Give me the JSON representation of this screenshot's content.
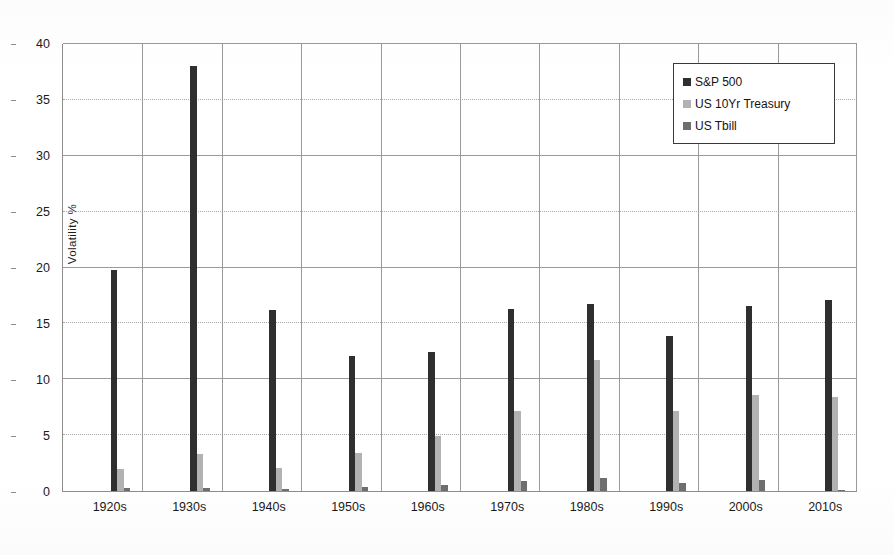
{
  "chart_data": {
    "type": "bar",
    "title": "",
    "subtitle": "",
    "xlabel": "",
    "ylabel": "Volatility  %",
    "ylim": [
      0,
      40
    ],
    "ytick_step": 5,
    "yticks": [
      40,
      35,
      30,
      25,
      20,
      15,
      10,
      5,
      0
    ],
    "grid": true,
    "grid_major_values": [
      40,
      30,
      20,
      10
    ],
    "grid_minor_values": [
      35,
      25,
      15,
      5
    ],
    "legend_position": "top-right",
    "categories": [
      "1920s",
      "1930s",
      "1940s",
      "1950s",
      "1960s",
      "1970s",
      "1980s",
      "1990s",
      "2000s",
      "2010s"
    ],
    "series": [
      {
        "name": "S&P 500",
        "color": "#2f2f2f",
        "values": [
          19.8,
          38.0,
          16.2,
          12.1,
          12.4,
          16.3,
          16.7,
          13.9,
          16.6,
          17.1
        ]
      },
      {
        "name": "US 10Yr Treasury",
        "color": "#b2b2b2",
        "values": [
          2.0,
          3.3,
          2.1,
          3.4,
          4.9,
          7.2,
          11.7,
          7.2,
          8.6,
          8.4
        ]
      },
      {
        "name": "US Tbill",
        "color": "#6e6e6e",
        "values": [
          0.25,
          0.3,
          0.15,
          0.4,
          0.55,
          0.9,
          1.2,
          0.75,
          0.95,
          0.1
        ]
      }
    ]
  },
  "legend": {
    "entries": [
      {
        "label": "S&P 500",
        "swatch": "legend-swatch-sp500"
      },
      {
        "label": "US 10Yr Treasury",
        "swatch": "legend-swatch-treasury"
      },
      {
        "label": "US Tbill",
        "swatch": "legend-swatch-tbill"
      }
    ]
  },
  "axes": {
    "y_title": "Volatility  %",
    "y_tick_labels": [
      "40",
      "35",
      "30",
      "25",
      "20",
      "15",
      "10",
      "5",
      "0"
    ],
    "x_tick_labels": [
      "1920s",
      "1930s",
      "1940s",
      "1950s",
      "1960s",
      "1970s",
      "1980s",
      "1990s",
      "2000s",
      "2010s"
    ]
  },
  "colors": {
    "series_sp500": "#2f2f2f",
    "series_treasury": "#b2b2b2",
    "series_tbill": "#6e6e6e",
    "grid": "#9a9a9a",
    "axis": "#8d8d8d",
    "text": "#1a1a1a",
    "background": "#ffffff"
  }
}
